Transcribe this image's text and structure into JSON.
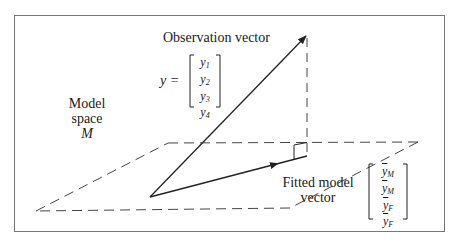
{
  "diagram": {
    "observation_label": "Observation vector",
    "y_equals": "y =",
    "observation_matrix": [
      {
        "base": "y",
        "sub": "1"
      },
      {
        "base": "y",
        "sub": "2"
      },
      {
        "base": "y",
        "sub": "3"
      },
      {
        "base": "y",
        "sub": "4"
      }
    ],
    "model_space_label": {
      "line1": "Model",
      "line2": "space",
      "symbol": "M"
    },
    "fitted_label": {
      "line1": "Fitted model",
      "line2": "vector"
    },
    "fitted_matrix": [
      {
        "base": "y",
        "sub": "M"
      },
      {
        "base": "y",
        "sub": "M"
      },
      {
        "base": "y",
        "sub": "F"
      },
      {
        "base": "y",
        "sub": "F"
      }
    ],
    "colors": {
      "line": "#222222",
      "dash": "#444444",
      "frame": "#777777"
    }
  }
}
